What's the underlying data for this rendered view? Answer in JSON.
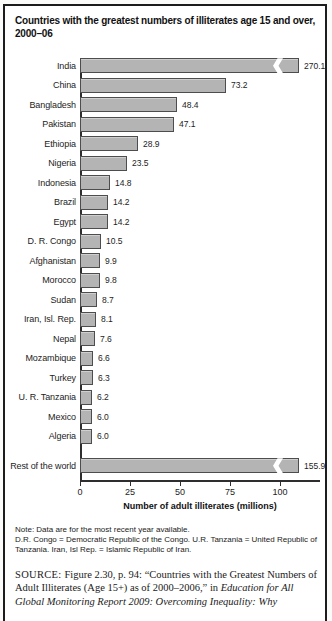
{
  "chart_data": {
    "type": "bar",
    "orientation": "horizontal",
    "title": "Countries with the greatest numbers of illiterates age 15 and over, 2000–06",
    "xlabel": "Number of adult illiterates (millions)",
    "xticks": [
      0,
      25,
      50,
      75,
      100
    ],
    "axis_range_units": 120,
    "categories": [
      "India",
      "China",
      "Bangladesh",
      "Pakistan",
      "Ethiopia",
      "Nigeria",
      "Indonesia",
      "Brazil",
      "Egypt",
      "D. R. Congo",
      "Afghanistan",
      "Morocco",
      "Sudan",
      "Iran, Isl. Rep.",
      "Nepal",
      "Mozambique",
      "Turkey",
      "U. R. Tanzania",
      "Mexico",
      "Algeria"
    ],
    "values": [
      270.1,
      73.2,
      48.4,
      47.1,
      28.9,
      23.5,
      14.8,
      14.2,
      14.2,
      10.5,
      9.9,
      9.8,
      8.7,
      8.1,
      7.6,
      6.6,
      6.3,
      6.2,
      6.0,
      6.0
    ],
    "rest_of_world": {
      "label": "Rest of the world",
      "value": 155.9
    },
    "broken_bars": [
      "India",
      "Rest of the world"
    ],
    "grid": false,
    "legend": false,
    "bar_color": "#b4b4b4",
    "bar_border_color": "#4d4d4d"
  },
  "note": {
    "line1": "Note: Data are for the most recent year available.",
    "line2": "D.R. Congo = Democratic Republic of the Congo. U.R. Tanzania = United Republic of Tanzania. Iran, Isl Rep. = Islamic Republic of Iran."
  },
  "source": {
    "label": "SOURCE:",
    "text": "Figure 2.30, p. 94: “Countries with the Greatest Numbers of Adult Illiterates (Age 15+) as of 2000–2006,” in ",
    "italic": "Education for All Global Monitoring Report 2009: Overcoming Inequality: Why"
  }
}
